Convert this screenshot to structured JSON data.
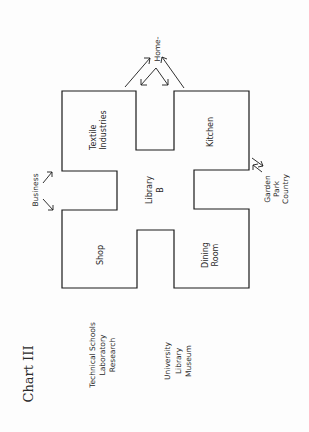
{
  "title": "Chart III",
  "rooms": {
    "textile": [
      "Textile",
      "Industries"
    ],
    "kitchen": [
      "Kitchen"
    ],
    "library": [
      "Library",
      "B"
    ],
    "shop": [
      "Shop"
    ],
    "dining": [
      "Dining",
      "Room"
    ]
  },
  "external": {
    "home": "Home-",
    "business": "Business",
    "garden": [
      "Garden",
      "Park",
      "Country"
    ],
    "technical": [
      "Technical Schools",
      "Laboratory",
      "Research"
    ],
    "university": [
      "University",
      "Library",
      "Museum"
    ]
  },
  "colors": {
    "line": "#1a1a1a",
    "background": "#fdfdfd",
    "text": "#2a2a2a"
  }
}
